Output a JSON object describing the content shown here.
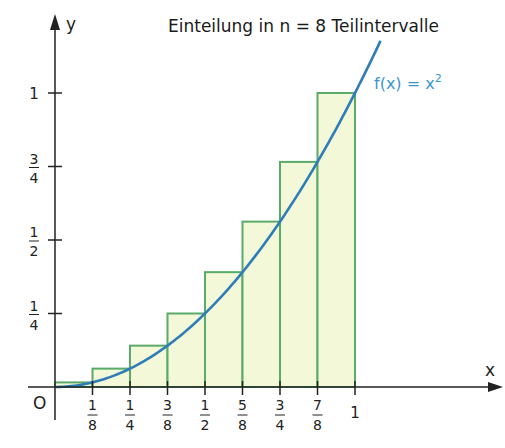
{
  "chart_data": {
    "type": "bar",
    "title": "Einteilung in n = 8 Teilintervalle",
    "xlabel": "x",
    "ylabel": "y",
    "origin_label": "O",
    "function_label": "f(x) = x",
    "function_label_exponent": "2",
    "function": "x^2",
    "n": 8,
    "xlim": [
      0,
      1
    ],
    "ylim": [
      0,
      1
    ],
    "x_ticks": [
      {
        "value": 0.125,
        "num": "1",
        "den": "8"
      },
      {
        "value": 0.25,
        "num": "1",
        "den": "4"
      },
      {
        "value": 0.375,
        "num": "3",
        "den": "8"
      },
      {
        "value": 0.5,
        "num": "1",
        "den": "2"
      },
      {
        "value": 0.625,
        "num": "5",
        "den": "8"
      },
      {
        "value": 0.75,
        "num": "3",
        "den": "4"
      },
      {
        "value": 0.875,
        "num": "7",
        "den": "8"
      },
      {
        "value": 1,
        "label": "1"
      }
    ],
    "y_ticks": [
      {
        "value": 0.25,
        "num": "1",
        "den": "4"
      },
      {
        "value": 0.5,
        "num": "1",
        "den": "2"
      },
      {
        "value": 0.75,
        "num": "3",
        "den": "4"
      },
      {
        "value": 1,
        "label": "1"
      }
    ],
    "rectangles": [
      {
        "x0": 0,
        "x1": 0.125,
        "height": 0.015625
      },
      {
        "x0": 0.125,
        "x1": 0.25,
        "height": 0.0625
      },
      {
        "x0": 0.25,
        "x1": 0.375,
        "height": 0.140625
      },
      {
        "x0": 0.375,
        "x1": 0.5,
        "height": 0.25
      },
      {
        "x0": 0.5,
        "x1": 0.625,
        "height": 0.390625
      },
      {
        "x0": 0.625,
        "x1": 0.75,
        "height": 0.5625
      },
      {
        "x0": 0.75,
        "x1": 0.875,
        "height": 0.765625
      },
      {
        "x0": 0.875,
        "x1": 1,
        "height": 1
      }
    ],
    "colors": {
      "rect_fill": "#f3f9d8",
      "rect_stroke": "#5aaa6a",
      "curve": "#2e7db8",
      "function_label": "#3a95d2",
      "axis": "#222222"
    }
  }
}
